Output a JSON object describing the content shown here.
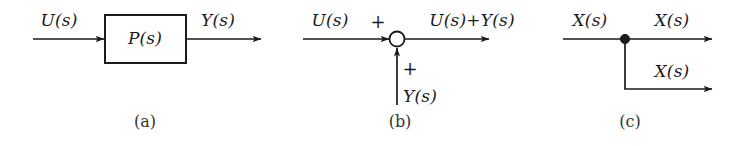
{
  "figure": {
    "background_color": "#ffffff",
    "line_color": "#1a1a1a",
    "text_color": "#1a1a1a"
  },
  "panels": [
    {
      "id": "a",
      "caption": "(a)",
      "name": "transfer-function-block",
      "block_label": "P(s)",
      "input_label": "U(s)",
      "output_label": "Y(s)"
    },
    {
      "id": "b",
      "caption": "(b)",
      "name": "summing-junction",
      "input_label": "U(s)",
      "input_sign": "+",
      "secondary_input_label": "Y(s)",
      "secondary_sign": "+",
      "output_label": "U(s)+Y(s)"
    },
    {
      "id": "c",
      "caption": "(c)",
      "name": "branch-point",
      "input_label": "X(s)",
      "output_label_top": "X(s)",
      "output_label_bottom": "X(s)"
    }
  ]
}
